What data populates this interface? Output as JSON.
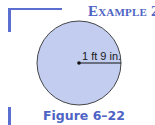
{
  "heading": {
    "word": "Example",
    "number": "2"
  },
  "figure": {
    "shape": "circle",
    "fill_color": "#c3cdf0",
    "stroke_color": "#333333",
    "radius_label": "1 ft 9 in.",
    "caption": "Figure 6–22"
  },
  "colors": {
    "accent": "#4e63c4",
    "bracket": "#5a6fd0"
  }
}
